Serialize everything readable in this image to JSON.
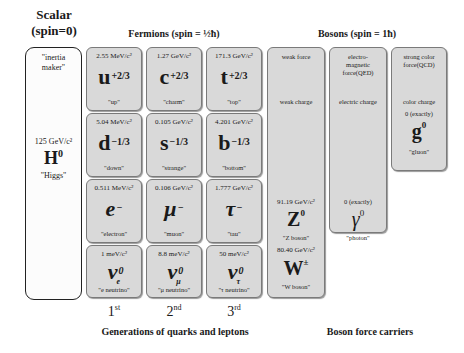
{
  "headers": {
    "scalar_line1": "Scalar",
    "scalar_line2": "(spin=0)",
    "fermions": "Fermions (spin = ½ħ)",
    "bosons": "Bosons (spin = 1ħ)"
  },
  "higgs": {
    "nickname": "\"inertia maker\"",
    "mass": "125 GeV/c²",
    "symbol": "H",
    "sup": "0",
    "name": "\"Higgs\""
  },
  "fermions": [
    [
      {
        "mass": "2.55 MeV/c²",
        "symbol": "u",
        "sup": "+2/3",
        "sub": "",
        "name": "\"up\""
      },
      {
        "mass": "1.27 GeV/c²",
        "symbol": "c",
        "sup": "+2/3",
        "sub": "",
        "name": "\"charm\""
      },
      {
        "mass": "171.3 GeV/c²",
        "symbol": "t",
        "sup": "+2/3",
        "sub": "",
        "name": "\"top\""
      }
    ],
    [
      {
        "mass": "5.04 MeV/c²",
        "symbol": "d",
        "sup": "−1/3",
        "sub": "",
        "name": "\"down\""
      },
      {
        "mass": "0.105 GeV/c²",
        "symbol": "s",
        "sup": "−1/3",
        "sub": "",
        "name": "\"strange\""
      },
      {
        "mass": "4.201 GeV/c²",
        "symbol": "b",
        "sup": "−1/3",
        "sub": "",
        "name": "\"bottom\""
      }
    ],
    [
      {
        "mass": "0.511 MeV/c²",
        "symbol": "e",
        "sup": "−",
        "sub": "",
        "name": "\"electron\""
      },
      {
        "mass": "0.106 GeV/c²",
        "symbol": "μ",
        "sup": "−",
        "sub": "",
        "name": "\"muon\""
      },
      {
        "mass": "1.777 GeV/c²",
        "symbol": "τ",
        "sup": "−",
        "sub": "",
        "name": "\"tau\""
      }
    ],
    [
      {
        "mass": "1 meV/c²",
        "symbol": "ν",
        "sup": "0",
        "sub": "e",
        "name": "\"e neutrino\""
      },
      {
        "mass": "8.8 meV/c²",
        "symbol": "ν",
        "sup": "0",
        "sub": "μ",
        "name": "\"μ neutrino\""
      },
      {
        "mass": "50 meV/c²",
        "symbol": "ν",
        "sup": "0",
        "sub": "τ",
        "name": "\"τ neutrino\""
      }
    ]
  ],
  "bosons": {
    "weak": {
      "force": "weak force",
      "charge": "weak charge",
      "z": {
        "mass": "91.19 GeV/c²",
        "symbol": "Z",
        "sup": "0",
        "name": "\"Z boson\""
      },
      "w": {
        "mass": "80.40 GeV/c²",
        "symbol": "W",
        "sup": "±",
        "name": "\"W boson\""
      }
    },
    "em": {
      "force_line1": "electro-",
      "force_line2": "magnetic",
      "force_line3": "force(QED)",
      "charge": "electric charge",
      "mass": "0 (exactly)",
      "symbol": "γ",
      "sup": "0",
      "name": "\"photon\""
    },
    "strong": {
      "force_line1": "strong color",
      "force_line2": "force(QCD)",
      "charge": "color charge",
      "mass": "0 (exactly)",
      "symbol": "g",
      "sup": "0",
      "name": "\"gluon\""
    }
  },
  "generations": [
    {
      "num": "1",
      "suffix": "st"
    },
    {
      "num": "2",
      "suffix": "nd"
    },
    {
      "num": "3",
      "suffix": "rd"
    }
  ],
  "footers": {
    "fermions": "Generations of quarks and leptons",
    "bosons": "Boson force carriers"
  },
  "colors": {
    "box_fill": "#d9d9d9",
    "box_border": "#7a7a7a",
    "higgs_border": "#222222"
  }
}
